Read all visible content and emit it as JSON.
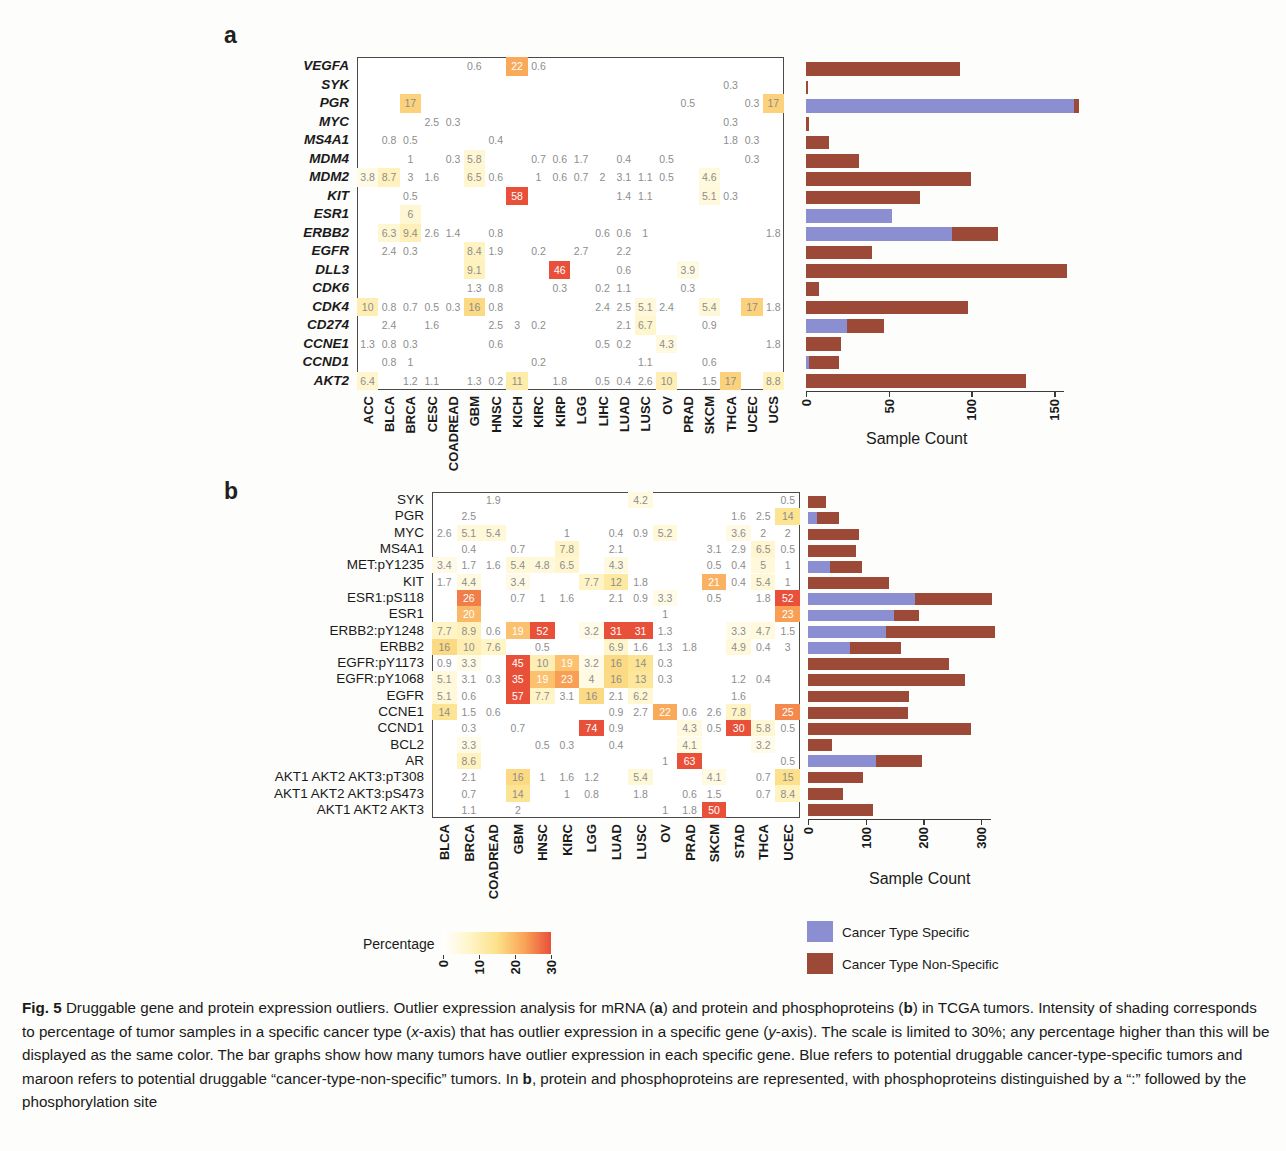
{
  "figure": {
    "panel_a_letter": "a",
    "panel_b_letter": "b",
    "caption_label": "Fig. 5",
    "caption_title": "Druggable gene and protein expression outliers.",
    "caption_body_1": " Outlier expression analysis for mRNA (",
    "caption_a": "a",
    "caption_body_2": ") and protein and phosphoproteins (",
    "caption_b": "b",
    "caption_body_3": ") in TCGA tumors. Intensity of shading corresponds to percentage of tumor samples in a specific cancer type (",
    "caption_xaxis": "x",
    "caption_body_4": "-axis) that has outlier expression in a specific gene (",
    "caption_yaxis": "y",
    "caption_body_5": "-axis). The scale is limited to 30%; any percentage higher than this will be displayed as the same color. The bar graphs show how many tumors have outlier expression in each specific gene. Blue refers to potential druggable cancer-type-specific tumors and maroon refers to potential druggable “cancer-type-non-specific” tumors. In ",
    "caption_b2": "b",
    "caption_body_6": ", protein and phosphoproteins are represented, with phosphoproteins distinguished by a “:” followed by the phosphorylation site"
  },
  "legend": {
    "percentage_label": "Percentage",
    "colorbar_ticks": [
      "0",
      "10",
      "20",
      "30"
    ],
    "colorbar_min": 0,
    "colorbar_max": 30,
    "colorbar_stops": [
      "#ffffff",
      "#fff5c8",
      "#fde18a",
      "#f9a557",
      "#e8503a"
    ],
    "key_specific_label": "Cancer Type Specific",
    "key_nonspecific_label": "Cancer Type Non-Specific",
    "color_specific": "#8b8ed0",
    "color_nonspecific": "#9c4a37"
  },
  "chart_data": [
    {
      "id": "panel_a_heatmap",
      "type": "heatmap",
      "title": "mRNA outlier expression",
      "xlabel": "",
      "ylabel": "",
      "colorbar_label": "Percentage",
      "zlim": [
        0,
        30
      ],
      "categories": [
        "ACC",
        "BLCA",
        "BRCA",
        "CESC",
        "COADREAD",
        "GBM",
        "HNSC",
        "KICH",
        "KIRC",
        "KIRP",
        "LGG",
        "LIHC",
        "LUAD",
        "LUSC",
        "OV",
        "PRAD",
        "SKCM",
        "THCA",
        "UCEC",
        "UCS"
      ],
      "rows": [
        "VEGFA",
        "SYK",
        "PGR",
        "MYC",
        "MS4A1",
        "MDM4",
        "MDM2",
        "KIT",
        "ESR1",
        "ERBB2",
        "EGFR",
        "DLL3",
        "CDK6",
        "CDK4",
        "CD274",
        "CCNE1",
        "CCND1",
        "AKT2"
      ],
      "values": [
        [
          null,
          null,
          null,
          null,
          null,
          0.6,
          null,
          22,
          0.6,
          null,
          null,
          null,
          null,
          null,
          null,
          null,
          null,
          null,
          null,
          null
        ],
        [
          null,
          null,
          null,
          null,
          null,
          null,
          null,
          null,
          null,
          null,
          null,
          null,
          null,
          null,
          null,
          null,
          null,
          0.3,
          null,
          null
        ],
        [
          null,
          null,
          17,
          null,
          null,
          null,
          null,
          null,
          null,
          null,
          null,
          null,
          null,
          null,
          null,
          0.5,
          null,
          null,
          0.3,
          17
        ],
        [
          null,
          null,
          null,
          2.5,
          0.3,
          null,
          null,
          null,
          null,
          null,
          null,
          null,
          null,
          null,
          null,
          null,
          null,
          0.3,
          null,
          null
        ],
        [
          null,
          0.8,
          0.5,
          null,
          null,
          null,
          0.4,
          null,
          null,
          null,
          null,
          null,
          null,
          null,
          null,
          null,
          null,
          1.8,
          0.3,
          null
        ],
        [
          null,
          null,
          1,
          null,
          0.3,
          5.8,
          null,
          null,
          0.7,
          0.6,
          1.7,
          null,
          0.4,
          null,
          0.5,
          null,
          null,
          null,
          0.3,
          null
        ],
        [
          3.8,
          8.7,
          3,
          1.6,
          null,
          6.5,
          0.6,
          null,
          1,
          0.6,
          0.7,
          2,
          3.1,
          1.1,
          0.5,
          null,
          4.6,
          null,
          null,
          null
        ],
        [
          null,
          null,
          0.5,
          null,
          null,
          null,
          null,
          58,
          null,
          null,
          null,
          null,
          1.4,
          1.1,
          null,
          null,
          5.1,
          0.3,
          null,
          null
        ],
        [
          null,
          null,
          6,
          null,
          null,
          null,
          null,
          null,
          null,
          null,
          null,
          null,
          null,
          null,
          null,
          null,
          null,
          null,
          null,
          null
        ],
        [
          null,
          6.3,
          9.4,
          2.6,
          1.4,
          null,
          0.8,
          null,
          null,
          null,
          null,
          0.6,
          0.6,
          1,
          null,
          null,
          null,
          null,
          null,
          1.8
        ],
        [
          null,
          2.4,
          0.3,
          null,
          null,
          8.4,
          1.9,
          null,
          0.2,
          null,
          2.7,
          null,
          2.2,
          null,
          null,
          null,
          null,
          null,
          null,
          null
        ],
        [
          null,
          null,
          null,
          null,
          null,
          9.1,
          null,
          null,
          null,
          46,
          null,
          null,
          0.6,
          null,
          null,
          3.9,
          null,
          null,
          null,
          null
        ],
        [
          null,
          null,
          null,
          null,
          null,
          1.3,
          0.8,
          null,
          null,
          0.3,
          null,
          0.2,
          1.1,
          null,
          null,
          0.3,
          null,
          null,
          null,
          null
        ],
        [
          10,
          0.8,
          0.7,
          0.5,
          0.3,
          16,
          0.8,
          null,
          null,
          null,
          null,
          2.4,
          2.5,
          5.1,
          2.4,
          null,
          5.4,
          null,
          17,
          1.8
        ],
        [
          null,
          2.4,
          null,
          1.6,
          null,
          null,
          2.5,
          3,
          0.2,
          null,
          null,
          null,
          2.1,
          6.7,
          null,
          null,
          0.9,
          null,
          null,
          null
        ],
        [
          1.3,
          0.8,
          0.3,
          null,
          null,
          null,
          0.6,
          null,
          null,
          null,
          null,
          0.5,
          0.2,
          null,
          4.3,
          null,
          null,
          null,
          null,
          1.8
        ],
        [
          null,
          0.8,
          1,
          null,
          null,
          null,
          null,
          null,
          0.2,
          null,
          null,
          null,
          null,
          1.1,
          null,
          null,
          0.6,
          null,
          null,
          null
        ],
        [
          6.4,
          null,
          1.2,
          1.1,
          null,
          1.3,
          0.2,
          11,
          null,
          1.8,
          null,
          0.5,
          0.4,
          2.6,
          10,
          null,
          1.5,
          17,
          null,
          8.8
        ]
      ]
    },
    {
      "id": "panel_a_bars",
      "type": "bar",
      "orientation": "horizontal",
      "stacked": true,
      "xlabel": "Sample Count",
      "xlim": [
        0,
        168
      ],
      "ticks": [
        0,
        50,
        100,
        150
      ],
      "tick_labels": [
        "0",
        "50",
        "100",
        "150"
      ],
      "categories": [
        "VEGFA",
        "SYK",
        "PGR",
        "MYC",
        "MS4A1",
        "MDM4",
        "MDM2",
        "KIT",
        "ESR1",
        "ERBB2",
        "EGFR",
        "DLL3",
        "CDK6",
        "CDK4",
        "CD274",
        "CCNE1",
        "CCND1",
        "AKT2"
      ],
      "series": [
        {
          "name": "Cancer Type Specific",
          "color": "#8b8ed0",
          "values": [
            0,
            0,
            162,
            0,
            0,
            0,
            0,
            0,
            52,
            88,
            0,
            0,
            0,
            0,
            25,
            0,
            2,
            0
          ]
        },
        {
          "name": "Cancer Type Non-Specific",
          "color": "#9c4a37",
          "values": [
            93,
            1,
            3,
            2,
            14,
            32,
            100,
            69,
            0,
            28,
            40,
            158,
            8,
            98,
            22,
            21,
            18,
            133
          ]
        }
      ]
    },
    {
      "id": "panel_b_heatmap",
      "type": "heatmap",
      "title": "protein and phosphoprotein outlier expression",
      "xlabel": "",
      "ylabel": "",
      "colorbar_label": "Percentage",
      "zlim": [
        0,
        30
      ],
      "categories": [
        "BLCA",
        "BRCA",
        "COADREAD",
        "GBM",
        "HNSC",
        "KIRC",
        "LGG",
        "LUAD",
        "LUSC",
        "OV",
        "PRAD",
        "SKCM",
        "STAD",
        "THCA",
        "UCEC"
      ],
      "rows": [
        "SYK",
        "PGR",
        "MYC",
        "MS4A1",
        "MET:pY1235",
        "KIT",
        "ESR1:pS118",
        "ESR1",
        "ERBB2:pY1248",
        "ERBB2",
        "EGFR:pY1173",
        "EGFR:pY1068",
        "EGFR",
        "CCNE1",
        "CCND1",
        "BCL2",
        "AR",
        "AKT1 AKT2 AKT3:pT308",
        "AKT1 AKT2 AKT3:pS473",
        "AKT1 AKT2 AKT3"
      ],
      "values": [
        [
          null,
          null,
          1.9,
          null,
          null,
          null,
          null,
          null,
          4.2,
          null,
          null,
          null,
          null,
          null,
          0.5
        ],
        [
          null,
          2.5,
          null,
          null,
          null,
          null,
          null,
          null,
          null,
          null,
          null,
          null,
          1.6,
          2.5,
          14
        ],
        [
          2.6,
          5.1,
          5.4,
          null,
          null,
          1,
          null,
          0.4,
          0.9,
          5.2,
          null,
          null,
          3.6,
          2,
          2
        ],
        [
          null,
          0.4,
          null,
          0.7,
          null,
          7.8,
          null,
          2.1,
          null,
          null,
          null,
          3.1,
          2.9,
          6.5,
          0.5
        ],
        [
          3.4,
          1.7,
          1.6,
          5.4,
          4.8,
          6.5,
          null,
          4.3,
          null,
          null,
          null,
          0.5,
          0.4,
          5,
          1
        ],
        [
          1.7,
          4.4,
          null,
          3.4,
          null,
          null,
          7.7,
          12,
          1.8,
          null,
          null,
          21,
          0.4,
          5.4,
          1
        ],
        [
          null,
          26,
          null,
          0.7,
          1,
          1.6,
          null,
          2.1,
          0.9,
          3.3,
          null,
          0.5,
          null,
          1.8,
          52
        ],
        [
          null,
          20,
          null,
          null,
          null,
          null,
          null,
          null,
          null,
          1,
          null,
          null,
          null,
          null,
          23
        ],
        [
          7.7,
          8.9,
          0.6,
          19,
          52,
          null,
          3.2,
          31,
          31,
          1.3,
          null,
          null,
          3.3,
          4.7,
          1.5
        ],
        [
          16,
          10,
          7.6,
          null,
          0.5,
          null,
          null,
          6.9,
          1.6,
          1.3,
          1.8,
          null,
          4.9,
          0.4,
          3
        ],
        [
          0.9,
          3.3,
          null,
          45,
          10,
          19,
          3.2,
          16,
          14,
          0.3,
          null,
          null,
          null,
          null,
          null
        ],
        [
          5.1,
          3.1,
          0.3,
          35,
          19,
          23,
          4,
          16,
          13,
          0.3,
          null,
          null,
          1.2,
          0.4,
          null
        ],
        [
          5.1,
          0.6,
          null,
          57,
          7.7,
          3.1,
          16,
          2.1,
          6.2,
          null,
          null,
          null,
          1.6,
          null,
          null
        ],
        [
          14,
          1.5,
          0.6,
          null,
          null,
          null,
          null,
          0.9,
          2.7,
          22,
          0.6,
          2.6,
          7.8,
          null,
          25
        ],
        [
          null,
          0.3,
          null,
          0.7,
          null,
          null,
          74,
          0.9,
          null,
          null,
          4.3,
          0.5,
          30,
          5.8,
          0.5
        ],
        [
          null,
          3.3,
          null,
          null,
          0.5,
          0.3,
          null,
          0.4,
          null,
          null,
          4.1,
          null,
          null,
          3.2,
          null
        ],
        [
          null,
          8.6,
          null,
          null,
          null,
          null,
          null,
          null,
          null,
          1,
          63,
          null,
          null,
          null,
          0.5
        ],
        [
          null,
          2.1,
          null,
          16,
          1,
          1.6,
          1.2,
          null,
          5.4,
          null,
          null,
          4.1,
          null,
          0.7,
          15
        ],
        [
          null,
          0.7,
          null,
          14,
          null,
          1,
          0.8,
          null,
          1.8,
          null,
          0.6,
          1.5,
          null,
          0.7,
          8.4
        ],
        [
          null,
          1.1,
          null,
          2,
          null,
          null,
          null,
          null,
          null,
          1,
          1.8,
          50,
          null,
          null,
          null
        ]
      ]
    },
    {
      "id": "panel_b_bars",
      "type": "bar",
      "orientation": "horizontal",
      "stacked": true,
      "xlabel": "Sample Count",
      "xlim": [
        0,
        340
      ],
      "ticks": [
        0,
        100,
        200,
        300
      ],
      "tick_labels": [
        "0",
        "100",
        "200",
        "300"
      ],
      "categories": [
        "SYK",
        "PGR",
        "MYC",
        "MS4A1",
        "MET:pY1235",
        "KIT",
        "ESR1:pS118",
        "ESR1",
        "ERBB2:pY1248",
        "ERBB2",
        "EGFR:pY1173",
        "EGFR:pY1068",
        "EGFR",
        "CCNE1",
        "CCND1",
        "BCL2",
        "AR",
        "AKT1 AKT2 AKT3:pT308",
        "AKT1 AKT2 AKT3:pS473",
        "AKT1 AKT2 AKT3"
      ],
      "series": [
        {
          "name": "Cancer Type Specific",
          "color": "#8b8ed0",
          "values": [
            0,
            16,
            0,
            0,
            38,
            0,
            185,
            150,
            135,
            72,
            0,
            0,
            0,
            0,
            0,
            0,
            118,
            0,
            0,
            0
          ]
        },
        {
          "name": "Cancer Type Non-Specific",
          "color": "#9c4a37",
          "values": [
            32,
            38,
            89,
            83,
            56,
            140,
            135,
            43,
            190,
            90,
            244,
            272,
            176,
            174,
            282,
            42,
            80,
            95,
            60,
            112
          ]
        }
      ]
    }
  ]
}
